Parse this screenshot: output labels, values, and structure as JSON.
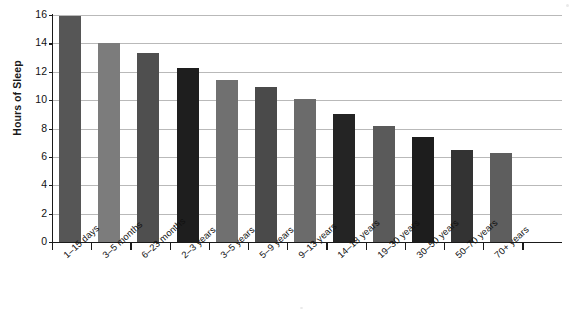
{
  "chart_data": {
    "type": "bar",
    "title": "",
    "xlabel": "",
    "ylabel": "Hours of Sleep",
    "ylim": [
      0,
      16
    ],
    "ytick_values": [
      0,
      2,
      4,
      6,
      8,
      10,
      12,
      14,
      16
    ],
    "ytick_labels": [
      "0",
      "2",
      "4",
      "6",
      "8",
      "10",
      "12",
      "14",
      "16"
    ],
    "grid": true,
    "legend": "none",
    "categories": [
      "1–15 days",
      "3–5 months",
      "6–23 months",
      "2–3 years",
      "3–5 years",
      "5–9 years",
      "9–13 years",
      "14–18 years",
      "19–30 years",
      "30–50 years",
      "50–70 years",
      "70+ years"
    ],
    "values": [
      15.9,
      14.0,
      13.3,
      12.3,
      11.4,
      10.9,
      10.1,
      9.0,
      8.2,
      7.4,
      6.5,
      6.3
    ],
    "bar_colors": [
      "#565656",
      "#7c7c7c",
      "#4f4f4f",
      "#1e1e1e",
      "#707070",
      "#4a4a4a",
      "#6b6b6b",
      "#242424",
      "#5a5a5a",
      "#1d1d1d",
      "#333333",
      "#5e5e5e",
      "#c3c3c3",
      "#8e8e8e"
    ],
    "axis_color": "#1a1a1a",
    "grid_color": "#b9b9b9",
    "background": "#ffffff"
  },
  "chart_series_full": {
    "categories": [
      "1–15 days",
      "3–5 months",
      "6–23 months",
      "2–3 years",
      "3–5 years",
      "5–9 years",
      "9–13 years",
      "14–18 years",
      "19–30 years",
      "30–50 years",
      "50–70 years",
      "70+ years"
    ]
  }
}
